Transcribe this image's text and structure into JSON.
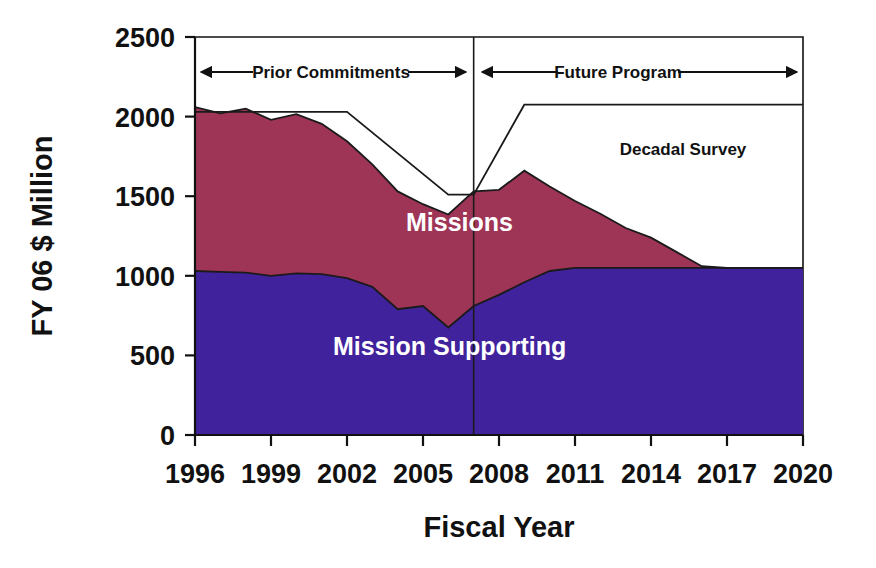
{
  "chart_data": {
    "type": "area",
    "title": "",
    "xlabel": "Fiscal Year",
    "ylabel": "FY 06 $ Million",
    "stacked": true,
    "grid": false,
    "legend_position": "inline-annotation",
    "xlim": [
      1996,
      2020
    ],
    "ylim": [
      0,
      2500
    ],
    "ytick_labels": [
      "0",
      "500",
      "1000",
      "1500",
      "2000",
      "2500"
    ],
    "ytick_values": [
      0,
      500,
      1000,
      1500,
      2000,
      2500
    ],
    "xtick_labels": [
      "1996",
      "1999",
      "2002",
      "2005",
      "2008",
      "2011",
      "2014",
      "2017",
      "2020"
    ],
    "xtick_values": [
      1996,
      1999,
      2002,
      2005,
      2008,
      2011,
      2014,
      2017,
      2020
    ],
    "x": [
      1996,
      1997,
      1998,
      1999,
      2000,
      2001,
      2002,
      2003,
      2004,
      2005,
      2006,
      2007,
      2008,
      2009,
      2010,
      2011,
      2012,
      2013,
      2014,
      2015,
      2016,
      2017,
      2018,
      2019,
      2020
    ],
    "series": [
      {
        "name": "Mission Supporting",
        "color": "#40239c",
        "values": [
          1030,
          1025,
          1020,
          1000,
          1015,
          1010,
          985,
          930,
          790,
          810,
          675,
          810,
          880,
          960,
          1030,
          1050,
          1050,
          1050,
          1050,
          1050,
          1050,
          1050,
          1050,
          1050,
          1050
        ]
      },
      {
        "name": "Missions",
        "color": "#9e3556",
        "values": [
          1030,
          995,
          1030,
          980,
          1000,
          945,
          860,
          770,
          740,
          640,
          710,
          720,
          660,
          700,
          530,
          420,
          340,
          250,
          190,
          100,
          10,
          0,
          0,
          0,
          0
        ]
      }
    ],
    "total_budget_line": {
      "name": "Decadal Survey",
      "x": [
        1996,
        2002,
        2006,
        2007,
        2009,
        2020
      ],
      "y": [
        2030,
        2030,
        1510,
        1510,
        2075,
        2075
      ]
    },
    "annotations": [
      {
        "label": "Missions",
        "kind": "series-label",
        "x": 2004.8,
        "y": 1320
      },
      {
        "label": "Mission Supporting",
        "kind": "series-label",
        "x": 2006.6,
        "y": 520
      },
      {
        "label": "Decadal Survey",
        "kind": "region-label",
        "x": 2015.2,
        "y": 1780
      },
      {
        "label": "Prior Commitments",
        "kind": "span-arrow",
        "from": 1996,
        "to": 2007,
        "y": 2245
      },
      {
        "label": "Future Program",
        "kind": "span-arrow",
        "from": 2007,
        "to": 2020,
        "y": 2245
      }
    ]
  },
  "axes": {
    "y_title": "FY 06 $ Million",
    "x_title": "Fiscal Year",
    "y_ticks": [
      "2500",
      "2000",
      "1500",
      "1000",
      "500",
      "0"
    ],
    "x_ticks": [
      "1996",
      "1999",
      "2002",
      "2005",
      "2008",
      "2011",
      "2014",
      "2017",
      "2020"
    ]
  },
  "labels": {
    "missions": "Missions",
    "mission_supporting": "Mission Supporting",
    "decadal_survey": "Decadal Survey",
    "prior_commitments": "Prior Commitments",
    "future_program": "Future Program"
  },
  "colors": {
    "missions": "#9e3556",
    "mission_supporting": "#40239c",
    "axis": "#111111",
    "background": "#ffffff",
    "label_text": "#ffffff"
  }
}
